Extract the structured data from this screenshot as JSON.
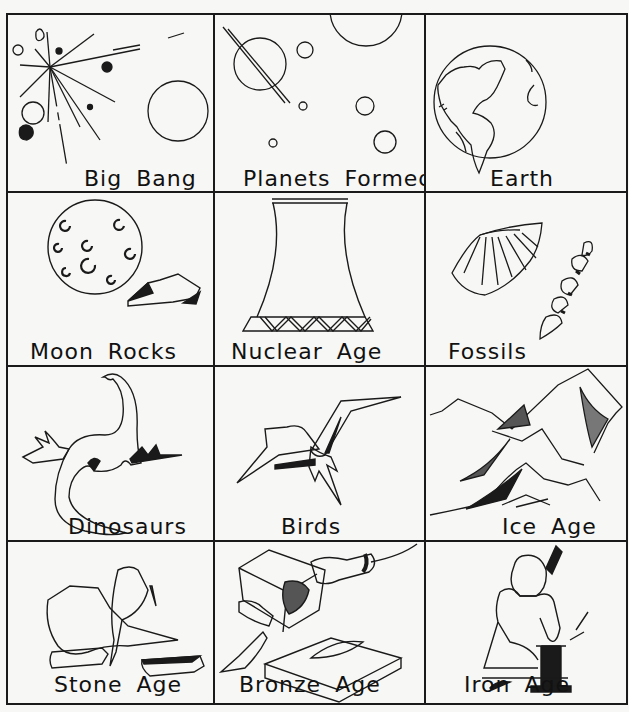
{
  "grid": {
    "rows": 4,
    "columns": 3,
    "cells": [
      {
        "label": "Big Bang",
        "icon": "big-bang-icon"
      },
      {
        "label": "Planets Formed",
        "icon": "planets-icon"
      },
      {
        "label": "Earth",
        "icon": "earth-globe-icon"
      },
      {
        "label": "Moon Rocks",
        "icon": "moon-rocks-icon"
      },
      {
        "label": "Nuclear Age",
        "icon": "cooling-tower-icon"
      },
      {
        "label": "Fossils",
        "icon": "fossil-shell-icon"
      },
      {
        "label": "Dinosaurs",
        "icon": "dinosaur-icon"
      },
      {
        "label": "Birds",
        "icon": "bird-icon"
      },
      {
        "label": "Ice Age",
        "icon": "mountains-icon"
      },
      {
        "label": "Stone  Age",
        "icon": "stone-tools-icon"
      },
      {
        "label": "Bronze Age",
        "icon": "bronze-mold-icon"
      },
      {
        "label": "Iron Age",
        "icon": "blacksmith-icon"
      }
    ]
  },
  "colors": {
    "ink": "#1a1a1a",
    "paper": "#f7f7f5"
  }
}
